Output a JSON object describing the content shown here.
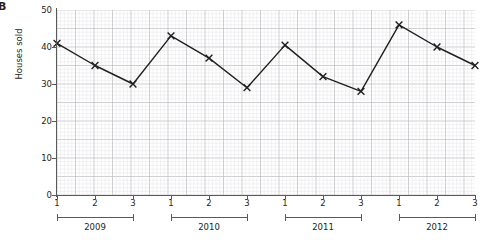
{
  "panel": {
    "letter": "B"
  },
  "chart_data": {
    "type": "line",
    "title": "",
    "xlabel": "",
    "ylabel": "Houses sold",
    "ylim": [
      0,
      50
    ],
    "ytick_values": [
      0,
      10,
      20,
      30,
      40,
      50
    ],
    "ytick_labels": [
      "0",
      "10",
      "20",
      "30",
      "40",
      "50"
    ],
    "grid": true,
    "grid_style": "graph-paper-fine",
    "legend": "none",
    "marker": "x",
    "line_color": "#231f20",
    "grid_minor_color": "#e3e3e6",
    "grid_major_color": "#bcbcc0",
    "axis_color": "#58595b",
    "categories": [
      "1",
      "2",
      "3",
      "1",
      "2",
      "3",
      "1",
      "2",
      "3",
      "1",
      "2",
      "3"
    ],
    "groups": [
      {
        "label": "2009",
        "quarters": [
          "1",
          "2",
          "3"
        ]
      },
      {
        "label": "2010",
        "quarters": [
          "1",
          "2",
          "3"
        ]
      },
      {
        "label": "2011",
        "quarters": [
          "1",
          "2",
          "3"
        ]
      },
      {
        "label": "2012",
        "quarters": [
          "1",
          "2",
          "3"
        ]
      }
    ],
    "values": [
      41,
      35,
      30,
      43,
      37,
      29,
      40.5,
      32,
      28,
      46,
      40,
      35
    ]
  }
}
